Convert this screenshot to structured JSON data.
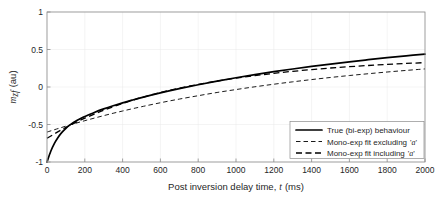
{
  "chart_data": {
    "type": "line",
    "title": "",
    "xlabel": "Post inversion delay time, t (ms)",
    "xlabel_prefix": "Post inversion delay time,",
    "xlabel_italic": "t",
    "xlabel_suffix": "(ms)",
    "ylabel": "m_zf (au)",
    "ylabel_main": "m",
    "ylabel_sub": "zf",
    "ylabel_unit": "(au)",
    "xlim": [
      0,
      2000
    ],
    "ylim": [
      -1,
      1
    ],
    "xticks": [
      0,
      200,
      400,
      600,
      800,
      1000,
      1200,
      1400,
      1600,
      1800,
      2000
    ],
    "yticks": [
      -1,
      -0.5,
      0,
      0.5,
      1
    ],
    "xtick_labels": [
      "0",
      "200",
      "400",
      "600",
      "800",
      "1000",
      "1200",
      "1400",
      "1600",
      "1800",
      "2000"
    ],
    "ytick_labels": [
      "-1",
      "-0.5",
      "0",
      "0.5",
      "1"
    ],
    "grid": true,
    "legend_position": "lower right",
    "series": [
      {
        "name": "True (bi-exp) behaviour",
        "style": "solid",
        "color": "#000000",
        "x": [
          0,
          20,
          40,
          60,
          80,
          100,
          120,
          140,
          160,
          180,
          200,
          250,
          300,
          350,
          400,
          450,
          500,
          600,
          700,
          800,
          900,
          1000,
          1100,
          1200,
          1300,
          1400,
          1500,
          1600,
          1700,
          1800,
          1900,
          2000
        ],
        "y": [
          -1.0,
          -0.857,
          -0.749,
          -0.666,
          -0.602,
          -0.551,
          -0.509,
          -0.474,
          -0.444,
          -0.417,
          -0.393,
          -0.339,
          -0.292,
          -0.25,
          -0.211,
          -0.175,
          -0.141,
          -0.079,
          -0.022,
          0.03,
          0.078,
          0.123,
          0.165,
          0.204,
          0.24,
          0.274,
          0.306,
          0.336,
          0.364,
          0.391,
          0.416,
          0.439
        ]
      },
      {
        "name": "Mono-exp fit excluding 'a'",
        "style": "fine-dashed",
        "color": "#000000",
        "x": [
          0,
          50,
          100,
          150,
          200,
          250,
          300,
          350,
          400,
          450,
          500,
          600,
          700,
          800,
          900,
          1000,
          1100,
          1200,
          1300,
          1400,
          1500,
          1600,
          1700,
          1800,
          1900,
          2000
        ],
        "y": [
          -0.601,
          -0.561,
          -0.522,
          -0.485,
          -0.449,
          -0.415,
          -0.382,
          -0.35,
          -0.32,
          -0.291,
          -0.263,
          -0.21,
          -0.161,
          -0.116,
          -0.073,
          -0.034,
          0.003,
          0.037,
          0.069,
          0.099,
          0.127,
          0.153,
          0.177,
          0.2,
          0.221,
          0.241
        ]
      },
      {
        "name": "Mono-exp fit including 'a'",
        "style": "coarse-dashed",
        "color": "#000000",
        "x": [
          0,
          50,
          100,
          150,
          200,
          250,
          300,
          350,
          400,
          450,
          500,
          600,
          700,
          800,
          900,
          1000,
          1100,
          1200,
          1300,
          1400,
          1500,
          1600,
          1700,
          1800,
          1900,
          2000
        ],
        "y": [
          -0.684,
          -0.609,
          -0.539,
          -0.475,
          -0.416,
          -0.361,
          -0.31,
          -0.263,
          -0.219,
          -0.179,
          -0.141,
          -0.074,
          -0.016,
          0.035,
          0.079,
          0.118,
          0.152,
          0.182,
          0.209,
          0.232,
          0.253,
          0.271,
          0.287,
          0.301,
          0.314,
          0.325
        ]
      }
    ],
    "legend_entries": [
      {
        "label": "True (bi-exp) behaviour",
        "style": "solid"
      },
      {
        "label_prefix": "Mono-exp fit excluding",
        "label_italic": "a",
        "label_quoted": "'a'",
        "style": "fine-dashed"
      },
      {
        "label_prefix": "Mono-exp fit including",
        "label_italic": "a",
        "label_quoted": "'a'",
        "style": "coarse-dashed"
      }
    ]
  },
  "colors": {
    "axis": "#8c8c8c",
    "grid": "#e8e8e8",
    "text": "#262626",
    "curve": "#000000",
    "background": "#ffffff"
  }
}
